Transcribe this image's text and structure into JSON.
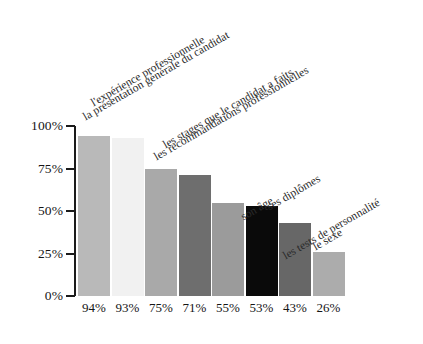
{
  "chart_data": {
    "type": "bar",
    "title": "",
    "subtitle": "",
    "xlabel": "",
    "ylabel": "",
    "ylim": [
      0,
      100
    ],
    "grid": false,
    "legend_position": "none",
    "orientation": "vertical",
    "categories": [
      "la présentation générale du candidat",
      "l'expérience professionnelle",
      "les recommandations professionnelles",
      "les stages que le candidat a faits",
      "son âge",
      "ses diplômes",
      "les tests de personnalité",
      "le sexe"
    ],
    "values": [
      94,
      93,
      75,
      71,
      55,
      53,
      43,
      26
    ],
    "value_labels": [
      "94%",
      "93%",
      "75%",
      "71%",
      "55%",
      "53%",
      "43%",
      "26%"
    ],
    "bar_colors": [
      "#b9b9b9",
      "#f1f1f1",
      "#a9a9a9",
      "#6e6e6e",
      "#9b9b9b",
      "#0a0a0a",
      "#676767",
      "#acacac"
    ],
    "y_ticks": [
      0,
      25,
      50,
      75,
      100
    ],
    "y_tick_labels": [
      "0%",
      "25%",
      "50%",
      "75%",
      "100%"
    ],
    "axis_color": "#1b1b1b",
    "background_color": "#ffffff",
    "label_rotation_deg": -30
  }
}
